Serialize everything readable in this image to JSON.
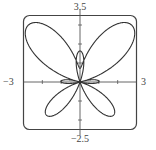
{
  "chart_data": {
    "type": "line",
    "title": "",
    "xlabel": "",
    "ylabel": "",
    "equation": "r = e^(sin θ) − 2cos(4θ)",
    "coordinate_system": "polar",
    "theta_range": [
      0,
      6.283185307
    ],
    "xlim": [
      -3,
      3
    ],
    "ylim": [
      -2.5,
      3.5
    ],
    "x_ticks": [
      -2,
      -1,
      1,
      2
    ],
    "y_ticks": [
      -2,
      -1,
      1,
      2,
      3
    ],
    "window_labels": {
      "xmin": "−3",
      "xmax": "3",
      "ymin": "−2.5",
      "ymax": "3.5"
    },
    "grid": false,
    "series": [
      {
        "name": "butterfly-curve",
        "color": "#333333"
      }
    ]
  }
}
